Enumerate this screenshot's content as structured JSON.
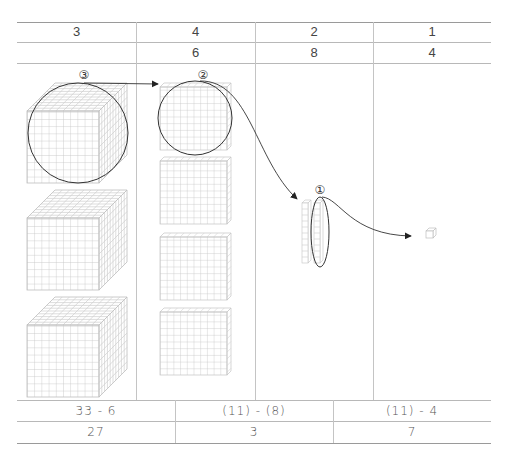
{
  "header_row_1": [
    "3",
    "4",
    "2",
    "1"
  ],
  "header_row_2": [
    "",
    "6",
    "8",
    "4"
  ],
  "steps": {
    "step3_label": "③",
    "step2_label": "②",
    "step1_label": "①"
  },
  "blocks": {
    "column_1": {
      "type": "thousand-cube",
      "count": 3
    },
    "column_2": {
      "type": "hundred-flat",
      "count": 4
    },
    "column_3": {
      "type": "ten-rod",
      "count": 2
    },
    "column_4": {
      "type": "unit-cube",
      "count": 1
    }
  },
  "footer_row_1": [
    "33 - 6",
    "(11) - (8)",
    "(11) - 4"
  ],
  "footer_row_2": [
    "27",
    "3",
    "7"
  ],
  "colors": {
    "line": "#b8b8b8",
    "grid": "#c8c8c8",
    "ink": "#333333"
  }
}
